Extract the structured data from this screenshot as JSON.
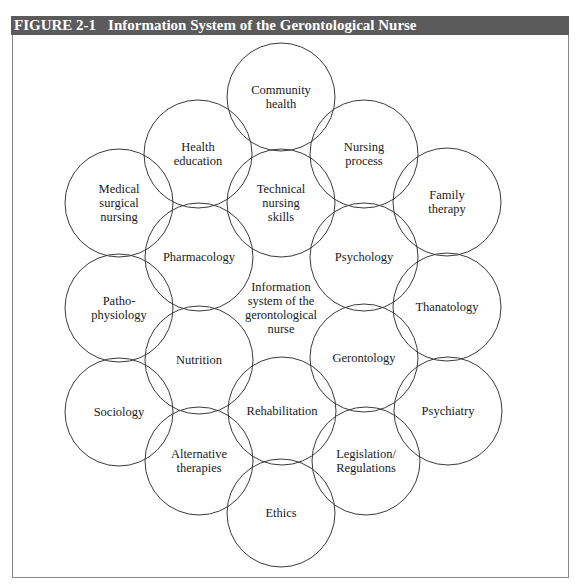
{
  "figure": {
    "number": "FIGURE 2-1",
    "title": "Information System of the Gerontological Nurse"
  },
  "diagram": {
    "center_label": "Information\nsystem of the\ngerontological\nnurse",
    "radius": 54,
    "nodes": [
      {
        "id": "community-health",
        "label": "Community\nhealth",
        "cx": 281,
        "cy": 97
      },
      {
        "id": "health-education",
        "label": "Health\neducation",
        "cx": 198,
        "cy": 154
      },
      {
        "id": "nursing-process",
        "label": "Nursing\nprocess",
        "cx": 364,
        "cy": 154
      },
      {
        "id": "medical-surgical-nursing",
        "label": "Medical\nsurgical\nnursing",
        "cx": 119,
        "cy": 203
      },
      {
        "id": "technical-nursing-skills",
        "label": "Technical\nnursing\nskills",
        "cx": 281,
        "cy": 203
      },
      {
        "id": "family-therapy",
        "label": "Family\ntherapy",
        "cx": 447,
        "cy": 202
      },
      {
        "id": "pharmacology",
        "label": "Pharmacology",
        "cx": 199,
        "cy": 257
      },
      {
        "id": "psychology",
        "label": "Psychology",
        "cx": 364,
        "cy": 257
      },
      {
        "id": "pathophysiology",
        "label": "Patho-\nphysiology",
        "cx": 119,
        "cy": 308
      },
      {
        "id": "thanatology",
        "label": "Thanatology",
        "cx": 447,
        "cy": 307
      },
      {
        "id": "nutrition",
        "label": "Nutrition",
        "cx": 199,
        "cy": 360
      },
      {
        "id": "gerontology",
        "label": "Gerontology",
        "cx": 364,
        "cy": 358
      },
      {
        "id": "sociology",
        "label": "Sociology",
        "cx": 119,
        "cy": 412
      },
      {
        "id": "rehabilitation",
        "label": "Rehabilitation",
        "cx": 282,
        "cy": 411
      },
      {
        "id": "psychiatry",
        "label": "Psychiatry",
        "cx": 448,
        "cy": 411
      },
      {
        "id": "alternative-therapies",
        "label": "Alternative\ntherapies",
        "cx": 199,
        "cy": 461
      },
      {
        "id": "legislation-regulations",
        "label": "Legislation/\nRegulations",
        "cx": 366,
        "cy": 461
      },
      {
        "id": "ethics",
        "label": "Ethics",
        "cx": 281,
        "cy": 513
      }
    ]
  }
}
